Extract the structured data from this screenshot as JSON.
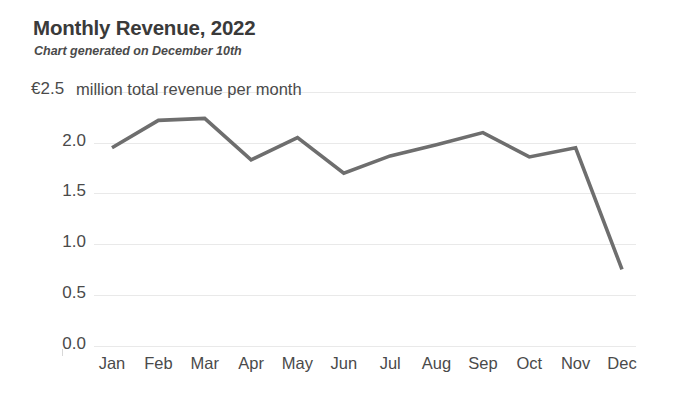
{
  "header": {
    "title": "Monthly Revenue, 2022",
    "subtitle": "Chart generated on December 10th"
  },
  "axis": {
    "unit_note": "million total revenue per month",
    "top_tick": "€2.5"
  },
  "colors": {
    "line": "#6e6e6e",
    "grid": "#e9e9e9",
    "text": "#4a4a4a",
    "title": "#3a3a3a"
  },
  "chart_data": {
    "type": "line",
    "title": "Monthly Revenue, 2022",
    "subtitle": "Chart generated on December 10th",
    "xlabel": "",
    "ylabel": "€ million total revenue per month",
    "categories": [
      "Jan",
      "Feb",
      "Mar",
      "Apr",
      "May",
      "Jun",
      "Jul",
      "Aug",
      "Sep",
      "Oct",
      "Nov",
      "Dec"
    ],
    "values": [
      1.95,
      2.22,
      2.24,
      1.83,
      2.05,
      1.7,
      1.87,
      1.98,
      2.1,
      1.86,
      1.95,
      0.75
    ],
    "ylim": [
      0.0,
      2.5
    ],
    "yticks": [
      "0.0",
      "0.5",
      "1.0",
      "1.5",
      "2.0",
      "€2.5"
    ],
    "ytick_values": [
      0.0,
      0.5,
      1.0,
      1.5,
      2.0,
      2.5
    ],
    "grid": "horizontal",
    "legend": "none",
    "series": [
      {
        "name": "Total revenue",
        "values": [
          1.95,
          2.22,
          2.24,
          1.83,
          2.05,
          1.7,
          1.87,
          1.98,
          2.1,
          1.86,
          1.95,
          0.75
        ]
      }
    ]
  }
}
